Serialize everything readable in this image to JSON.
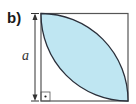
{
  "figure": {
    "part_label": "b)",
    "dimension_label": "a",
    "shape": "square with lens-shaped region formed by two quarter-circle arcs",
    "right_angle_marker": "dot-in-square",
    "colors": {
      "fill": "#bfe6f2",
      "stroke": "#2a2f3a",
      "square_border": "#555555"
    }
  }
}
